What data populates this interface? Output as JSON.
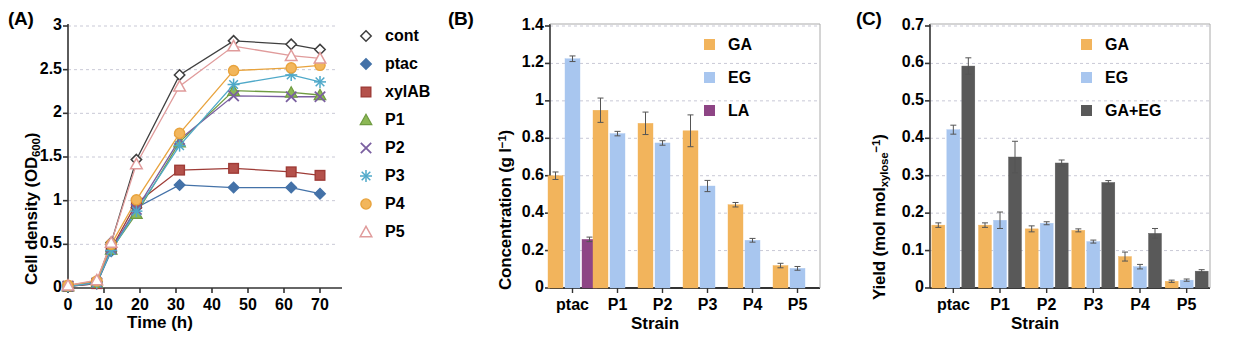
{
  "figure": {
    "panels": [
      {
        "id": "A",
        "letter": "(A)",
        "chart_data": {
          "type": "line",
          "title": "",
          "xlabel": "Time (h)",
          "ylabel": "Cell density (OD600)",
          "ylabel_main": "Cell density (OD",
          "ylabel_sub": "600",
          "ylabel_tail": ")",
          "xlim": [
            0,
            75
          ],
          "ylim": [
            0,
            3
          ],
          "yticks": [
            "0",
            "0.5",
            "1",
            "1.5",
            "2",
            "2.5",
            "3"
          ],
          "ytickvals": [
            0,
            0.5,
            1,
            1.5,
            2,
            2.5,
            3
          ],
          "xticks": [
            "0",
            "10",
            "20",
            "30",
            "40",
            "50",
            "60",
            "70"
          ],
          "xtickvals": [
            0,
            10,
            20,
            30,
            40,
            50,
            60,
            70
          ],
          "grid": true,
          "legend_position": "right",
          "x": [
            0,
            8,
            12,
            19,
            31,
            46,
            62,
            70
          ],
          "series": [
            {
              "name": "cont",
              "marker": "open-diamond",
              "color": "#3f3f3f",
              "fill": "#ffffff",
              "values": [
                0.03,
                0.07,
                0.52,
                1.47,
                2.44,
                2.83,
                2.79,
                2.73
              ]
            },
            {
              "name": "ptac",
              "marker": "filled-diamond",
              "color": "#4472a8",
              "fill": "#4472a8",
              "values": [
                0.02,
                0.05,
                0.42,
                0.92,
                1.18,
                1.15,
                1.15,
                1.08
              ]
            },
            {
              "name": "xylAB",
              "marker": "filled-square",
              "color": "#9e3b36",
              "fill": "#b4514b",
              "values": [
                0.02,
                0.05,
                0.45,
                0.97,
                1.35,
                1.37,
                1.33,
                1.29
              ]
            },
            {
              "name": "P1",
              "marker": "filled-triangle",
              "color": "#6f9b41",
              "fill": "#8cb855",
              "values": [
                0.02,
                0.06,
                0.44,
                0.85,
                1.67,
                2.26,
                2.24,
                2.21
              ]
            },
            {
              "name": "P2",
              "marker": "cross-x",
              "color": "#7a5fa0",
              "fill": "#8b6db5",
              "values": [
                0.02,
                0.06,
                0.45,
                0.9,
                1.7,
                2.2,
                2.19,
                2.19
              ]
            },
            {
              "name": "P3",
              "marker": "asterisk",
              "color": "#4fa9c9",
              "fill": "#63bcd9",
              "values": [
                0.02,
                0.06,
                0.43,
                0.88,
                1.63,
                2.33,
                2.44,
                2.36
              ]
            },
            {
              "name": "P4",
              "marker": "filled-circle",
              "color": "#e8a33d",
              "fill": "#f2b65c",
              "values": [
                0.03,
                0.08,
                0.5,
                1.01,
                1.77,
                2.49,
                2.52,
                2.55
              ]
            },
            {
              "name": "P5",
              "marker": "open-triangle",
              "color": "#e09b9b",
              "fill": "#ffffff",
              "values": [
                0.03,
                0.09,
                0.52,
                1.42,
                2.31,
                2.77,
                2.66,
                2.63
              ]
            }
          ]
        }
      },
      {
        "id": "B",
        "letter": "(B)",
        "chart_data": {
          "type": "bar",
          "title": "",
          "xlabel": "Strain",
          "ylabel": "Concentration (g l-1)",
          "ylabel_main": "Concentration (g l",
          "ylabel_sup": "−1",
          "ylabel_tail": ")",
          "ylim": [
            0,
            1.4
          ],
          "yticks": [
            "0",
            "0.2",
            "0.4",
            "0.6",
            "0.8",
            "1",
            "1.2",
            "1.4"
          ],
          "ytickvals": [
            0,
            0.2,
            0.4,
            0.6,
            0.8,
            1.0,
            1.2,
            1.4
          ],
          "categories": [
            "ptac",
            "P1",
            "P2",
            "P3",
            "P4",
            "P5"
          ],
          "grid": true,
          "legend_position": "top-right",
          "series": [
            {
              "name": "GA",
              "color": "#f2b45c",
              "values": [
                0.6,
                0.95,
                0.88,
                0.84,
                0.445,
                0.12
              ],
              "errors": [
                0.02,
                0.065,
                0.06,
                0.085,
                0.012,
                0.012
              ]
            },
            {
              "name": "EG",
              "color": "#a8c6ef",
              "values": [
                1.225,
                0.825,
                0.775,
                0.545,
                0.255,
                0.105
              ],
              "errors": [
                0.015,
                0.012,
                0.012,
                0.03,
                0.01,
                0.01
              ]
            },
            {
              "name": "LA",
              "color": "#8e4585",
              "values": [
                0.26,
                null,
                null,
                null,
                null,
                null
              ],
              "errors": [
                0.012,
                null,
                null,
                null,
                null,
                null
              ]
            }
          ]
        }
      },
      {
        "id": "C",
        "letter": "(C)",
        "chart_data": {
          "type": "bar",
          "title": "",
          "xlabel": "Strain",
          "ylabel": "Yield (mol molxylose-1)",
          "ylabel_main": "Yield (mol mol",
          "ylabel_sub": "xylose",
          "ylabel_sup": "−1",
          "ylabel_tail": ")",
          "ylim": [
            0,
            0.7
          ],
          "yticks": [
            "0",
            "0.1",
            "0.2",
            "0.3",
            "0.4",
            "0.5",
            "0.6",
            "0.7"
          ],
          "ytickvals": [
            0,
            0.1,
            0.2,
            0.3,
            0.4,
            0.5,
            0.6,
            0.7
          ],
          "categories": [
            "ptac",
            "P1",
            "P2",
            "P3",
            "P4",
            "P5"
          ],
          "grid": true,
          "legend_position": "top-right",
          "series": [
            {
              "name": "GA",
              "color": "#f2b45c",
              "values": [
                0.168,
                0.168,
                0.158,
                0.154,
                0.084,
                0.018
              ],
              "errors": [
                0.006,
                0.006,
                0.008,
                0.004,
                0.012,
                0.003
              ]
            },
            {
              "name": "EG",
              "color": "#a8c6ef",
              "values": [
                0.423,
                0.181,
                0.173,
                0.124,
                0.057,
                0.021
              ],
              "errors": [
                0.012,
                0.022,
                0.004,
                0.004,
                0.006,
                0.003
              ]
            },
            {
              "name": "GA+EG",
              "color": "#595959",
              "values": [
                0.593,
                0.35,
                0.334,
                0.282,
                0.146,
                0.045
              ],
              "errors": [
                0.022,
                0.042,
                0.008,
                0.005,
                0.013,
                0.004
              ]
            }
          ]
        }
      }
    ]
  }
}
